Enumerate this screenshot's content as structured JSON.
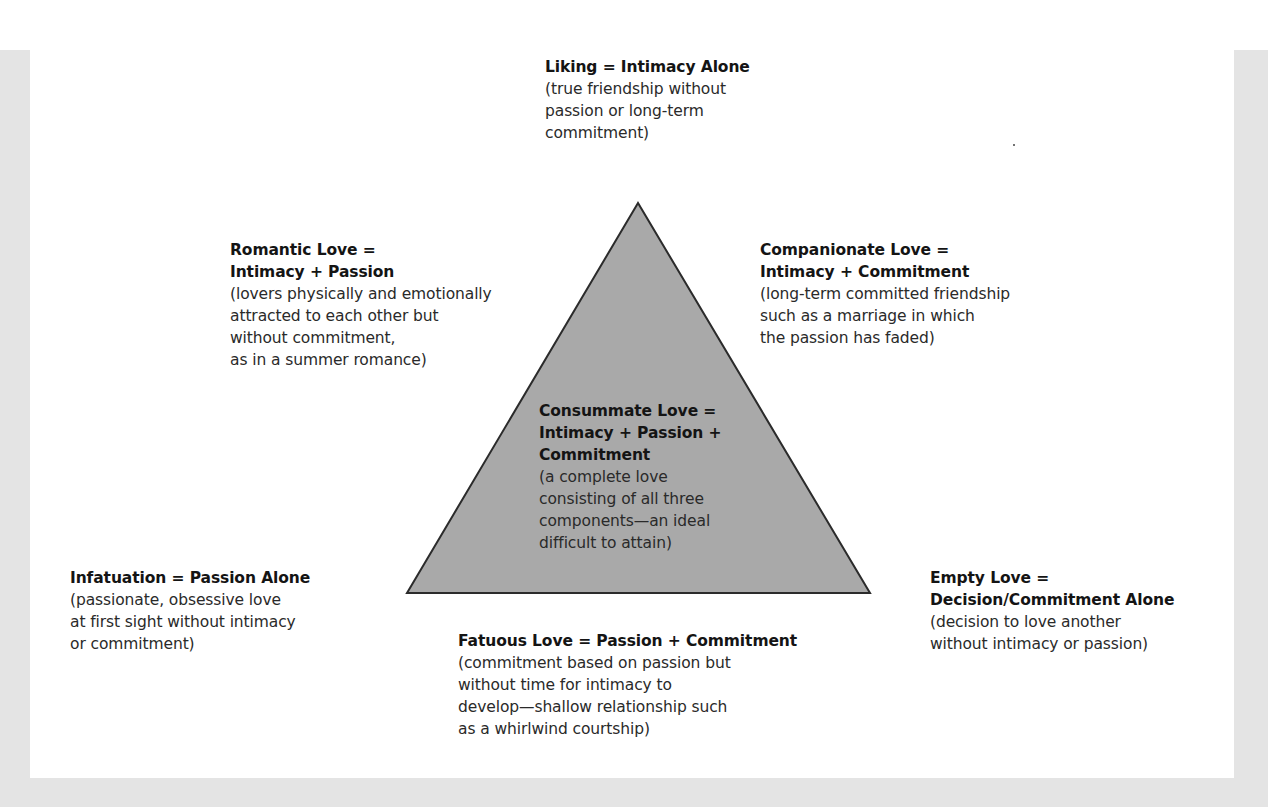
{
  "diagram": {
    "type": "triangular-theory-of-love",
    "shape": {
      "kind": "triangle",
      "fill": "#a9a9a9",
      "stroke": "#2b2b2b",
      "apex": [
        638,
        203
      ],
      "bottom_left": [
        407,
        593
      ],
      "bottom_right": [
        870,
        593
      ]
    },
    "colors": {
      "frame": "#e4e4e4",
      "panel": "#ffffff",
      "text": "#2a2a2a",
      "title_text": "#141414"
    },
    "labels": {
      "liking": {
        "title": "Liking = Intimacy Alone",
        "desc": "(true friendship without\npassion or long-term\ncommitment)"
      },
      "romantic": {
        "title": "Romantic Love =\nIntimacy + Passion",
        "desc": "(lovers physically and emotionally\nattracted to each other but\nwithout commitment,\nas in a summer romance)"
      },
      "companionate": {
        "title": "Companionate Love =\nIntimacy + Commitment",
        "desc": "(long-term committed friendship\nsuch as a marriage in which\nthe passion has faded)"
      },
      "consummate": {
        "title": "Consummate Love =\nIntimacy + Passion +\nCommitment",
        "desc": "(a complete love\nconsisting of all three\ncomponents—an ideal\ndifficult to attain)"
      },
      "infatuation": {
        "title": "Infatuation = Passion Alone",
        "desc": "(passionate, obsessive love\nat first sight without intimacy\nor commitment)"
      },
      "empty": {
        "title": "Empty Love =\nDecision/Commitment Alone",
        "desc": "(decision to love another\nwithout intimacy or passion)"
      },
      "fatuous": {
        "title": "Fatuous Love = Passion + Commitment",
        "desc": "(commitment based on passion but\nwithout time for intimacy to\ndevelop—shallow relationship such\nas a whirlwind courtship)"
      }
    }
  }
}
